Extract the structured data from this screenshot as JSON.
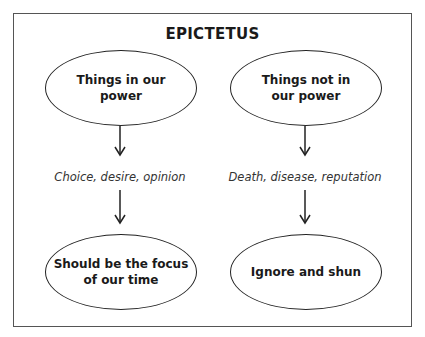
{
  "title": "EPICTETUS",
  "columns": [
    {
      "top_node": "Things in our power",
      "top_node_lines": [
        "Things in our",
        "power"
      ],
      "examples": "Choice, desire, opinion",
      "bottom_node_lines": [
        "Should be the focus",
        "of our time"
      ]
    },
    {
      "top_node": "Things not in our power",
      "top_node_lines": [
        "Things not in",
        "our power"
      ],
      "examples": "Death, disease, reputation",
      "bottom_node_lines": [
        "Ignore and shun"
      ]
    }
  ],
  "colors": {
    "stroke": "#222222",
    "frame": "#555555",
    "text": "#1a1a1a"
  }
}
